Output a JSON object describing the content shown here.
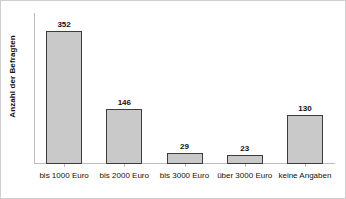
{
  "chart_data": {
    "type": "bar",
    "title": "",
    "subtitle": "",
    "xlabel": "",
    "ylabel": "Anzahl der Befragten",
    "categories": [
      "bis 1000 Euro",
      "bis 2000 Euro",
      "bis 3000 Euro",
      "über 3000 Euro",
      "keine Angaben"
    ],
    "values": [
      352,
      146,
      29,
      23,
      130
    ],
    "value_labels": [
      "352",
      "146",
      "29",
      "23",
      "130"
    ],
    "ylim": [
      0,
      400
    ],
    "grid": false,
    "legend": null,
    "series": [
      {
        "name": "Anzahl der Befragten",
        "values": [
          352,
          146,
          29,
          23,
          130
        ]
      }
    ],
    "style": {
      "bar_fill": "#c9c9c9",
      "bar_border": "#3c3c3c",
      "axis_color": "#bdbdbd",
      "text_color": "#111111",
      "frame_color": "#cfcfcf",
      "background": "#ffffff"
    }
  }
}
